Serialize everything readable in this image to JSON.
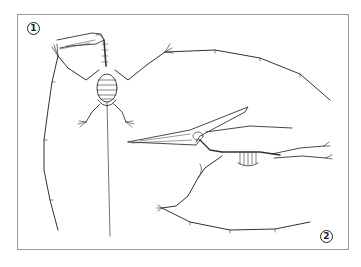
{
  "figure": {
    "panels": [
      {
        "label": "1",
        "view": "dorsal view, wings spread, long wing finger"
      },
      {
        "label": "2",
        "view": "lateral view, crested skull, wings extended"
      }
    ],
    "colors": {
      "border": "#9a9a9a",
      "ink": "#333333",
      "background": "#ffffff"
    }
  }
}
